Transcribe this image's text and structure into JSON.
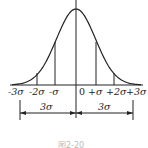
{
  "diagram": {
    "axis_labels": [
      "-3σ",
      "-2σ",
      "-σ",
      "0",
      "+σ",
      "+2σ",
      "+3σ"
    ],
    "dimensions": {
      "left": "3σ",
      "right": "3σ"
    },
    "caption": "图2-20",
    "colors": {
      "line": "#222222",
      "background": "#ffffff"
    }
  },
  "chart_data": {
    "type": "line",
    "x": [
      -3,
      -2,
      -1,
      0,
      1,
      2,
      3
    ],
    "tick_labels": [
      "-3σ",
      "-2σ",
      "-σ",
      "0",
      "+σ",
      "+2σ",
      "+3σ"
    ],
    "values": [
      0.0044,
      0.054,
      0.242,
      0.399,
      0.242,
      0.054,
      0.0044
    ],
    "vertical_lines_at": [
      -2,
      -1,
      1,
      2
    ],
    "annotations": [
      "3σ",
      "3σ"
    ],
    "xlabel": "",
    "ylabel": "",
    "grid": false
  }
}
